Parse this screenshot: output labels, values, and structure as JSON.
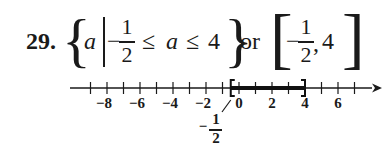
{
  "problem": {
    "number": "29.",
    "set_builder": {
      "open_brace": "{",
      "variable": "a",
      "condition_minus": "−",
      "lower_numerator": "1",
      "lower_denominator": "2",
      "leq1": "≤",
      "variable2": "a",
      "leq2": "≤",
      "upper": "4",
      "close_brace": "}"
    },
    "connector": "or",
    "interval": {
      "open_bracket": "[",
      "minus": "−",
      "numerator": "1",
      "denominator": "2",
      "comma": ",",
      "upper": "4",
      "close_bracket": "]"
    }
  },
  "number_line": {
    "tick_min": -9,
    "tick_max": 7,
    "labels": [
      {
        "value": -8,
        "text": "−8"
      },
      {
        "value": -6,
        "text": "−6"
      },
      {
        "value": -4,
        "text": "−4"
      },
      {
        "value": -2,
        "text": "−2"
      },
      {
        "value": 0,
        "text": "0"
      },
      {
        "value": 2,
        "text": "2"
      },
      {
        "value": 4,
        "text": "4"
      },
      {
        "value": 6,
        "text": "6"
      }
    ],
    "shaded_interval": {
      "from": -0.5,
      "to": 4,
      "left": "closed",
      "right": "closed"
    },
    "callout": {
      "minus": "−",
      "numerator": "1",
      "denominator": "2"
    },
    "arrow": "right"
  }
}
